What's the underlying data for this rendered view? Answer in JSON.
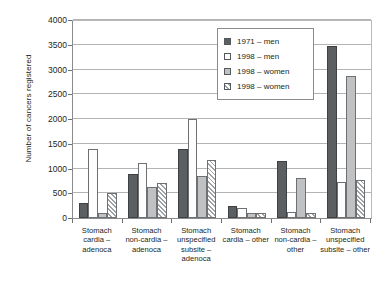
{
  "chart_data": {
    "type": "bar",
    "title": "",
    "xlabel": "",
    "ylabel": "Number of cancers registered",
    "ylim": [
      0,
      4000
    ],
    "ytick_step": 500,
    "yticks": [
      "0",
      "500",
      "1000",
      "1500",
      "2000",
      "2500",
      "3000",
      "3500",
      "4000"
    ],
    "grid": true,
    "legend_position": "top-center-inside",
    "categories": [
      "Stomach cardia – adenoca",
      "Stomach non-cardia – adenoca",
      "Stomach unspecified subsite – adenoca",
      "Stomach cardia – other",
      "Stomach non-cardia – other",
      "Stomach unspecified subsite – other"
    ],
    "category_lines": [
      [
        "Stomach",
        "cardia –",
        "adenoca"
      ],
      [
        "Stomach",
        "non-cardia –",
        "adenoca"
      ],
      [
        "Stomach",
        "unspecified",
        "subsite –",
        "adenoca"
      ],
      [
        "Stomach",
        "cardia – other"
      ],
      [
        "Stomach",
        "non-cardia –",
        "other"
      ],
      [
        "Stomach",
        "unspecified",
        "subsite – other"
      ]
    ],
    "series": [
      {
        "name": "1971 – men",
        "swatch": "dark-solid",
        "color": "#5b5f62",
        "values": [
          300,
          880,
          1400,
          240,
          1150,
          3470
        ]
      },
      {
        "name": "1998 – men",
        "swatch": "white-open",
        "color": "#fdfdfd",
        "values": [
          1400,
          1120,
          2000,
          200,
          120,
          730
        ]
      },
      {
        "name": "1998 – women",
        "swatch": "light-gray",
        "color": "#bfc1c2",
        "values": [
          100,
          620,
          850,
          110,
          810,
          2870
        ]
      },
      {
        "name": "1998 – women",
        "swatch": "diagonal-hatch",
        "color": "#9fa2a4",
        "values": [
          500,
          700,
          1180,
          110,
          100,
          760
        ]
      }
    ]
  },
  "legend": {
    "items": [
      {
        "label": "1971 – men"
      },
      {
        "label": "1998 – men"
      },
      {
        "label": "1998 – women"
      },
      {
        "label": "1998 – women"
      }
    ]
  },
  "axis": {
    "y_title": "Number of cancers registered"
  }
}
